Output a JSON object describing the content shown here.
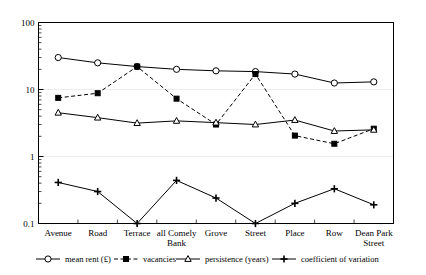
{
  "chart_data": {
    "type": "line",
    "title": "",
    "subtitle": "",
    "xlabel": "",
    "ylabel": "",
    "yscale": "log",
    "ylim": [
      0.1,
      100
    ],
    "ytick_labels": [
      "100",
      "10",
      "1",
      "0.1"
    ],
    "ytick_values": [
      100,
      10,
      1,
      0.1
    ],
    "grid": "horizontal-major-only",
    "legend_position": "bottom",
    "categories": [
      "Avenue",
      "Road",
      "Terrace",
      "all Comely Bank",
      "Grove",
      "Street",
      "Place",
      "Row",
      "Dean Park Street"
    ],
    "category_labels_wrapped": [
      [
        "Avenue"
      ],
      [
        "Road"
      ],
      [
        "Terrace"
      ],
      [
        "all Comely",
        "Bank"
      ],
      [
        "Grove"
      ],
      [
        "Street"
      ],
      [
        "Place"
      ],
      [
        "Row"
      ],
      [
        "Dean Park",
        "Street"
      ]
    ],
    "series": [
      {
        "name": "mean rent (£)",
        "marker": "open-circle",
        "line": "solid",
        "values": [
          30,
          25,
          22,
          20,
          19,
          18.5,
          17,
          12.5,
          13
        ]
      },
      {
        "name": "vacancies",
        "marker": "filled-square",
        "line": "dashed",
        "values": [
          7.5,
          8.8,
          22,
          7.3,
          3.0,
          17,
          2.05,
          1.55,
          2.6
        ]
      },
      {
        "name": "persistence (years)",
        "marker": "open-triangle",
        "line": "solid",
        "values": [
          4.5,
          3.8,
          3.15,
          3.4,
          3.2,
          3.0,
          3.5,
          2.4,
          2.5
        ]
      },
      {
        "name": "coefficient of variation",
        "marker": "plus",
        "line": "solid",
        "values": [
          0.41,
          0.3,
          0.1,
          0.44,
          0.24,
          0.1,
          0.2,
          0.33,
          0.19
        ]
      }
    ]
  },
  "legend": {
    "entries": [
      {
        "label": "mean rent (£)"
      },
      {
        "label": "vacancies"
      },
      {
        "label": "persistence (years)"
      },
      {
        "label": "coefficient of variation"
      }
    ]
  },
  "colors": {
    "line": "#000000",
    "grid": "#e8e8e8",
    "background": "#ffffff",
    "frame": "#000000"
  }
}
